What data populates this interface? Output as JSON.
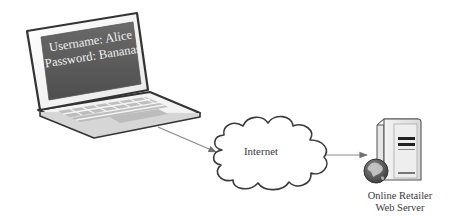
{
  "diagram": {
    "nodes": [
      {
        "id": "laptop",
        "type": "laptop",
        "screen_lines": [
          "Username: Alice",
          "Password: Bananas"
        ]
      },
      {
        "id": "internet",
        "type": "cloud",
        "label": "Internet"
      },
      {
        "id": "server",
        "type": "web-server",
        "label_lines": [
          "Online Retailer",
          "Web Server"
        ]
      }
    ],
    "edges": [
      {
        "from": "laptop",
        "to": "internet",
        "style": "arrow"
      },
      {
        "from": "internet",
        "to": "server",
        "style": "arrow"
      }
    ]
  },
  "colors": {
    "outline": "#333333",
    "screen": "#5a5a5a",
    "keys": "#b8b8b8",
    "line": "#8a8a8a",
    "globe": "#555555"
  }
}
